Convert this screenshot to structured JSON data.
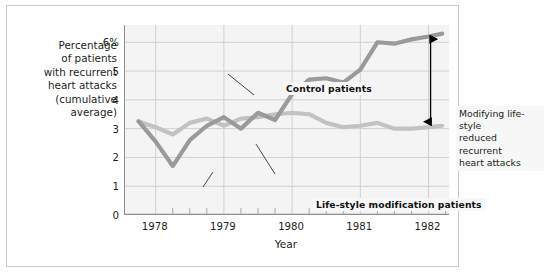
{
  "figure": {
    "y_axis_caption": "Percentage\nof patients\nwith recurrent\nheart attacks\n(cumulative\naverage)",
    "x_axis_title": "Year",
    "annotations": {
      "control": "Control patients",
      "lifestyle": "Life-style modification patients",
      "callout": "Modifying life-style\nreduced recurrent\nheart attacks"
    }
  },
  "colors": {
    "control_line": "#9a9a9a",
    "lifestyle_line": "#c2c2c2",
    "plot_background": "#f4f4f4",
    "gridline": "#d0d0d0",
    "axis": "#8d8d8d",
    "text": "#231f20",
    "arrow": "#000000",
    "frame": "#c9c9c9"
  },
  "chart_data": {
    "type": "line",
    "title": "",
    "xlabel": "Year",
    "ylabel": "Percentage of patients with recurrent heart attacks (cumulative average)",
    "xlim": [
      1977.55,
      1982.3
    ],
    "ylim": [
      0,
      6.6
    ],
    "yticks": [
      0,
      1,
      2,
      3,
      4,
      5,
      6
    ],
    "ytick_labels": [
      "0",
      "1",
      "2",
      "3",
      "4",
      "5",
      "6%"
    ],
    "xticks": [
      1978,
      1979,
      1980,
      1981,
      1982
    ],
    "xtick_labels": [
      "1978",
      "1979",
      "1980",
      "1981",
      "1982"
    ],
    "minor_xtick_interval": 0.25,
    "grid": true,
    "grid_axis": "both",
    "legend": "inline-annotations",
    "series": [
      {
        "name": "Control patients",
        "color": "#9a9a9a",
        "x": [
          1977.75,
          1978.0,
          1978.25,
          1978.5,
          1978.75,
          1979.0,
          1979.25,
          1979.5,
          1979.75,
          1980.0,
          1980.25,
          1980.5,
          1980.75,
          1981.0,
          1981.25,
          1981.5,
          1981.75,
          1982.0,
          1982.2
        ],
        "values": [
          3.25,
          2.55,
          1.7,
          2.6,
          3.1,
          3.4,
          3.0,
          3.55,
          3.3,
          4.2,
          4.7,
          4.75,
          4.6,
          5.05,
          6.0,
          5.95,
          6.1,
          6.2,
          6.3
        ]
      },
      {
        "name": "Life-style modification patients",
        "color": "#c2c2c2",
        "x": [
          1977.75,
          1978.0,
          1978.25,
          1978.5,
          1978.75,
          1979.0,
          1979.25,
          1979.5,
          1979.75,
          1980.0,
          1980.25,
          1980.5,
          1980.75,
          1981.0,
          1981.25,
          1981.5,
          1981.75,
          1982.0,
          1982.2
        ],
        "values": [
          3.25,
          3.05,
          2.8,
          3.2,
          3.35,
          3.1,
          3.35,
          3.4,
          3.5,
          3.55,
          3.5,
          3.2,
          3.05,
          3.1,
          3.2,
          3.0,
          3.0,
          3.05,
          3.1
        ]
      }
    ],
    "annotations": [
      {
        "name": "difference-arrow",
        "text": "Modifying life-style reduced recurrent heart attacks",
        "x": 1982.03,
        "y_top": 6.25,
        "y_bottom": 3.1,
        "style": "double-headed-vertical-arrow"
      }
    ]
  }
}
